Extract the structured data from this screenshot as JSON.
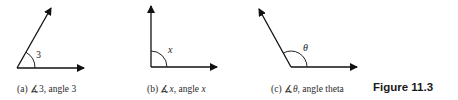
{
  "figure": {
    "label": "Figure 11.3",
    "panels": [
      {
        "id": "a",
        "caption_prefix": "(a) ",
        "angle_symbol": "∡",
        "angle_name": "3",
        "caption_suffix": ", angle ",
        "caption_name": "3",
        "arc_label": "3"
      },
      {
        "id": "b",
        "caption_prefix": "(b) ",
        "angle_symbol": "∡",
        "angle_name": "x",
        "caption_suffix": ", angle ",
        "caption_name": "x",
        "arc_label": "x"
      },
      {
        "id": "c",
        "caption_prefix": "(c) ",
        "angle_symbol": "∡",
        "angle_name": "θ",
        "caption_suffix": ", angle theta",
        "caption_name": "",
        "arc_label": "θ"
      }
    ]
  }
}
